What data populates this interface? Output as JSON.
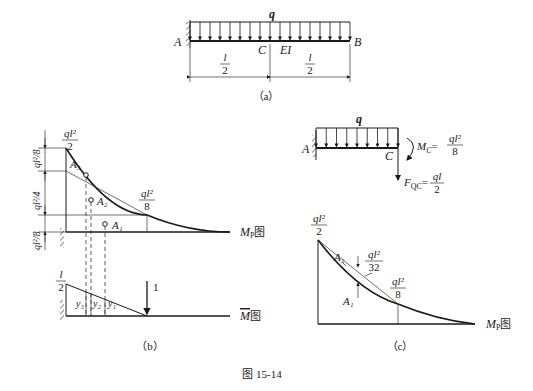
{
  "figure_caption": "图 15-14",
  "panel_a": {
    "label": "（a）",
    "load_label": "q",
    "support_label": "A",
    "mid_label": "C",
    "end_label": "B",
    "stiffness_label": "EI",
    "dim_left": {
      "num": "l",
      "den": "2"
    },
    "dim_right": {
      "num": "l",
      "den": "2"
    }
  },
  "panel_b": {
    "label": "（b）",
    "mp_diagram": {
      "top_value": {
        "num": "ql²",
        "den": "2"
      },
      "mid_value": {
        "num": "ql²",
        "den": "8"
      },
      "dims": [
        "ql²/8",
        "ql²/4",
        "ql²/8"
      ],
      "areas": [
        "A₃",
        "A₂",
        "A₁"
      ],
      "name": "M",
      "name_sub": "P",
      "name_suffix": "图"
    },
    "m_bar_diagram": {
      "top_value": {
        "num": "l",
        "den": "2"
      },
      "ordinates": [
        "y₃",
        "y₂",
        "y₁"
      ],
      "unit_load": "1",
      "name": "M",
      "name_suffix": "图"
    }
  },
  "panel_c": {
    "label": "（c）",
    "free_body": {
      "load_label": "q",
      "support_label": "A",
      "end_label": "C",
      "moment_label": "M",
      "moment_sub": "C",
      "moment_value": {
        "num": "ql²",
        "den": "8"
      },
      "shear_label": "F",
      "shear_sub": "QC",
      "shear_value": {
        "num": "ql",
        "den": "2"
      }
    },
    "mp_diagram": {
      "top_value": {
        "num": "ql²",
        "den": "2"
      },
      "mid_value": {
        "num": "ql²",
        "den": "8"
      },
      "parabola_value": {
        "num": "ql²",
        "den": "32"
      },
      "areas": [
        "A₂",
        "A₁"
      ],
      "name": "M",
      "name_sub": "P",
      "name_suffix": "图"
    }
  }
}
